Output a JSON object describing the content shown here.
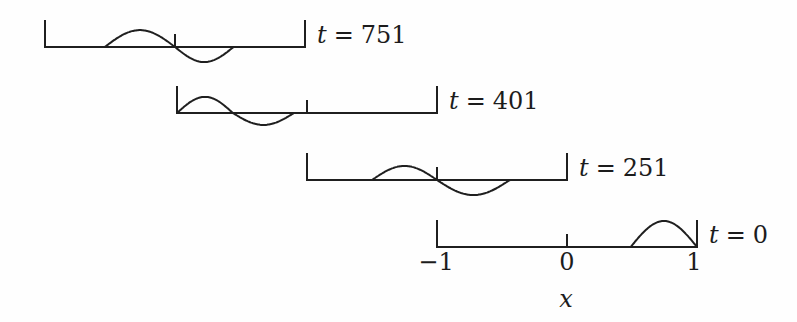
{
  "figure": {
    "background_color": "#fefefe",
    "ink_color": "#1f1f1f"
  },
  "chart_data": {
    "type": "line",
    "title": "",
    "xlabel": "x",
    "x_range": [
      -1,
      1
    ],
    "x_tick_values": [
      -1,
      0,
      1
    ],
    "x_tick_labels": [
      "−1",
      "0",
      "1"
    ],
    "grid": false,
    "legend": "none",
    "layout": "four staggered axes, one per time value, offset down-right; time label at right end of each axis",
    "panels": [
      {
        "time": 751,
        "time_label": {
          "symbol": "t",
          "relation": "=",
          "value": "751"
        },
        "humps": [
          {
            "x_start": -0.54,
            "x_end": 0.0,
            "amplitude": 0.65
          },
          {
            "x_start": 0.0,
            "x_end": 0.45,
            "amplitude": -0.58
          }
        ]
      },
      {
        "time": 401,
        "time_label": {
          "symbol": "t",
          "relation": "=",
          "value": "401"
        },
        "humps": [
          {
            "x_start": -1.0,
            "x_end": -0.57,
            "amplitude": 0.62
          },
          {
            "x_start": -0.57,
            "x_end": -0.1,
            "amplitude": -0.46
          }
        ]
      },
      {
        "time": 251,
        "time_label": {
          "symbol": "t",
          "relation": "=",
          "value": "251"
        },
        "humps": [
          {
            "x_start": -0.5,
            "x_end": 0.0,
            "amplitude": 0.54
          },
          {
            "x_start": 0.0,
            "x_end": 0.56,
            "amplitude": -0.58
          }
        ]
      },
      {
        "time": 0,
        "time_label": {
          "symbol": "t",
          "relation": "=",
          "value": "0"
        },
        "humps": [
          {
            "x_start": 0.49,
            "x_end": 1.0,
            "amplitude": 1.0
          }
        ]
      }
    ]
  }
}
